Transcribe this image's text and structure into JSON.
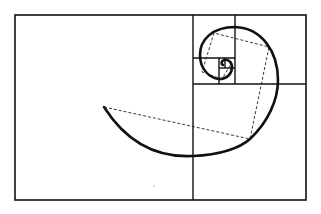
{
  "diagram": {
    "type": "golden-spiral",
    "elements": {
      "outer_rectangle": "golden rectangle",
      "subdivisions": "nested squares",
      "spiral": "logarithmic spiral through square corners",
      "chords": "dashed polygon connecting spiral quarter points"
    },
    "colors": {
      "ink": "#111111",
      "background": "#ffffff"
    }
  }
}
